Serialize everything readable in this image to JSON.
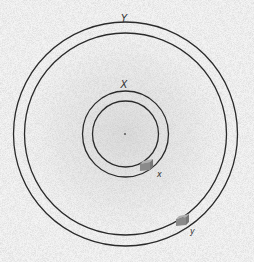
{
  "diagram": {
    "background": "#f4f4f4",
    "center": {
      "x": 125.5,
      "y": 134
    },
    "orbits": [
      {
        "id": "Y",
        "label": "Y",
        "outer_radius": 112,
        "inner_radius": 101
      },
      {
        "id": "X",
        "label": "X",
        "outer_radius": 43,
        "inner_radius": 33
      }
    ],
    "objects": [
      {
        "id": "x",
        "label": "x",
        "orbit": "X"
      },
      {
        "id": "y",
        "label": "y",
        "orbit": "Y"
      }
    ],
    "colors": {
      "ring": "#2a2a2a",
      "block": "#8a8a8a",
      "block_top": "#b0b0b0",
      "noise": "#9a9a9a"
    }
  }
}
